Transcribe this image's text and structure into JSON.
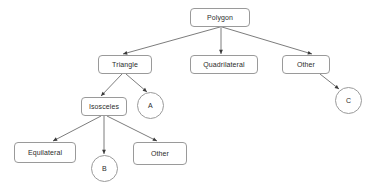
{
  "diagram": {
    "background_color": "#ffffff",
    "node_border_color": "#9a9a9a",
    "node_fill_color": "#ffffff",
    "edge_color": "#5a5a5a",
    "text_color": "#2b2b2b",
    "nodes": [
      {
        "id": "polygon",
        "label": "Polygon",
        "shape": "box",
        "x": 190,
        "y": 8,
        "w": 60,
        "h": 19
      },
      {
        "id": "triangle",
        "label": "Triangle",
        "shape": "box",
        "x": 98,
        "y": 55,
        "w": 54,
        "h": 19
      },
      {
        "id": "quadrilateral",
        "label": "Quadrilateral",
        "shape": "box",
        "x": 190,
        "y": 55,
        "w": 68,
        "h": 19
      },
      {
        "id": "other-top",
        "label": "Other",
        "shape": "box",
        "x": 282,
        "y": 55,
        "w": 48,
        "h": 19
      },
      {
        "id": "circle-c",
        "label": "C",
        "shape": "circle",
        "x": 335,
        "y": 87,
        "w": 27,
        "h": 27
      },
      {
        "id": "isosceles",
        "label": "Isosceles",
        "shape": "box",
        "x": 81,
        "y": 97,
        "w": 46,
        "h": 19
      },
      {
        "id": "circle-a",
        "label": "A",
        "shape": "circle",
        "x": 137,
        "y": 92,
        "w": 27,
        "h": 27
      },
      {
        "id": "equilateral",
        "label": "Equilateral",
        "shape": "box",
        "x": 14,
        "y": 142,
        "w": 62,
        "h": 21
      },
      {
        "id": "circle-b",
        "label": "B",
        "shape": "circle",
        "x": 91,
        "y": 155,
        "w": 27,
        "h": 27
      },
      {
        "id": "other-bottom",
        "label": "Other",
        "shape": "box",
        "x": 133,
        "y": 142,
        "w": 54,
        "h": 23
      }
    ],
    "edges": [
      {
        "from": "polygon",
        "to": "triangle",
        "x1": 220,
        "y1": 27,
        "x2": 123,
        "y2": 54
      },
      {
        "from": "polygon",
        "to": "quadrilateral",
        "x1": 221,
        "y1": 27,
        "x2": 221,
        "y2": 54
      },
      {
        "from": "polygon",
        "to": "other-top",
        "x1": 222,
        "y1": 27,
        "x2": 312,
        "y2": 54
      },
      {
        "from": "other-top",
        "to": "circle-c",
        "x1": 320,
        "y1": 74,
        "x2": 339,
        "y2": 89
      },
      {
        "from": "triangle",
        "to": "isosceles",
        "x1": 122,
        "y1": 74,
        "x2": 101,
        "y2": 96
      },
      {
        "from": "triangle",
        "to": "circle-a",
        "x1": 126,
        "y1": 74,
        "x2": 147,
        "y2": 92
      },
      {
        "from": "isosceles",
        "to": "equilateral",
        "x1": 101,
        "y1": 116,
        "x2": 53,
        "y2": 141
      },
      {
        "from": "isosceles",
        "to": "circle-b",
        "x1": 104,
        "y1": 116,
        "x2": 104,
        "y2": 154
      },
      {
        "from": "isosceles",
        "to": "other-bottom",
        "x1": 107,
        "y1": 116,
        "x2": 157,
        "y2": 141
      }
    ]
  }
}
